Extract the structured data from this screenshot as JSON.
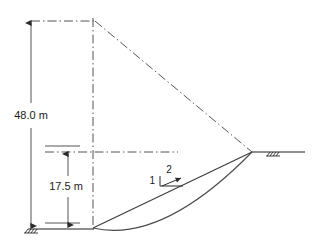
{
  "figure": {
    "type": "engineering-diagram"
  },
  "dimensions": {
    "total_height_label": "48.0 m",
    "lower_height_label": "17.5 m"
  },
  "slope_ratio": {
    "vertical_label": "1",
    "horizontal_label": "2"
  },
  "geometry": {
    "toe_x": 93,
    "toe_y": 228,
    "crest_x": 252,
    "crest_y": 152,
    "apex_x": 93,
    "apex_y": 21,
    "ground_left_x": 28,
    "ground_right_x": 305,
    "arc_low_x": 152,
    "arc_low_y": 233
  },
  "colors": {
    "line": "#3a3a3a",
    "center_line": "#555555",
    "ground": "#6a6a6a",
    "text": "#1a1a1a",
    "background": "#ffffff"
  }
}
